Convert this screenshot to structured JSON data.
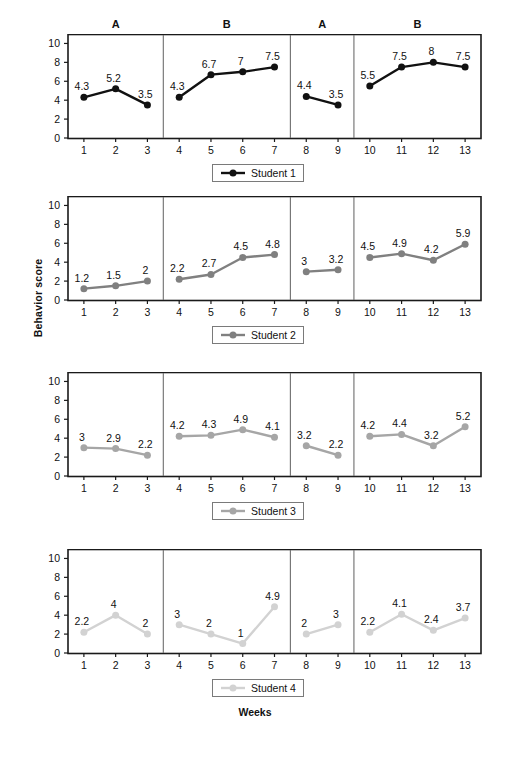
{
  "figure": {
    "y_axis_label": "Behavior score",
    "x_axis_label": "Weeks",
    "phase_labels": [
      "A",
      "B",
      "A",
      "B"
    ]
  },
  "chart_data": {
    "type": "line",
    "title": "",
    "xlabel": "Weeks",
    "ylabel": "Behavior score",
    "x": [
      1,
      2,
      3,
      4,
      5,
      6,
      7,
      8,
      9,
      10,
      11,
      12,
      13
    ],
    "xlim": [
      0.5,
      13.5
    ],
    "ylim": [
      0,
      11
    ],
    "yticks": [
      0,
      2,
      4,
      6,
      8,
      10
    ],
    "xticks": [
      1,
      2,
      3,
      4,
      5,
      6,
      7,
      8,
      9,
      10,
      11,
      12,
      13
    ],
    "grid": false,
    "legend_position": "below-each-panel",
    "design": "ABAB reversal",
    "phases": [
      {
        "label": "A",
        "weeks": [
          1,
          2,
          3
        ]
      },
      {
        "label": "B",
        "weeks": [
          4,
          5,
          6,
          7
        ]
      },
      {
        "label": "A",
        "weeks": [
          8,
          9
        ]
      },
      {
        "label": "B",
        "weeks": [
          10,
          11,
          12,
          13
        ]
      }
    ],
    "panels": [
      {
        "legend": "Student 1",
        "color": "#111111",
        "segments": [
          {
            "phase": "A",
            "x": [
              1,
              2,
              3
            ],
            "values": [
              4.3,
              5.2,
              3.5
            ],
            "labels": [
              "4.3",
              "5.2",
              "3.5"
            ]
          },
          {
            "phase": "B",
            "x": [
              4,
              5,
              6,
              7
            ],
            "values": [
              4.3,
              6.7,
              7,
              7.5
            ],
            "labels": [
              "4.3",
              "6.7",
              "7",
              "7.5"
            ]
          },
          {
            "phase": "A",
            "x": [
              8,
              9
            ],
            "values": [
              4.4,
              3.5
            ],
            "labels": [
              "4.4",
              "3.5"
            ]
          },
          {
            "phase": "B",
            "x": [
              10,
              11,
              12,
              13
            ],
            "values": [
              5.5,
              7.5,
              8,
              7.5
            ],
            "labels": [
              "5.5",
              "7.5",
              "8",
              "7.5"
            ]
          }
        ]
      },
      {
        "legend": "Student 2",
        "color": "#808080",
        "segments": [
          {
            "phase": "A",
            "x": [
              1,
              2,
              3
            ],
            "values": [
              1.2,
              1.5,
              2
            ],
            "labels": [
              "1.2",
              "1.5",
              "2"
            ]
          },
          {
            "phase": "B",
            "x": [
              4,
              5,
              6,
              7
            ],
            "values": [
              2.2,
              2.7,
              4.5,
              4.8
            ],
            "labels": [
              "2.2",
              "2.7",
              "4.5",
              "4.8"
            ]
          },
          {
            "phase": "A",
            "x": [
              8,
              9
            ],
            "values": [
              3,
              3.2
            ],
            "labels": [
              "3",
              "3.2"
            ]
          },
          {
            "phase": "B",
            "x": [
              10,
              11,
              12,
              13
            ],
            "values": [
              4.5,
              4.9,
              4.2,
              5.9
            ],
            "labels": [
              "4.5",
              "4.9",
              "4.2",
              "5.9"
            ]
          }
        ]
      },
      {
        "legend": "Student 3",
        "color": "#a6a6a6",
        "segments": [
          {
            "phase": "A",
            "x": [
              1,
              2,
              3
            ],
            "values": [
              3,
              2.9,
              2.2
            ],
            "labels": [
              "3",
              "2.9",
              "2.2"
            ]
          },
          {
            "phase": "B",
            "x": [
              4,
              5,
              6,
              7
            ],
            "values": [
              4.2,
              4.3,
              4.9,
              4.1
            ],
            "labels": [
              "4.2",
              "4.3",
              "4.9",
              "4.1"
            ]
          },
          {
            "phase": "A",
            "x": [
              8,
              9
            ],
            "values": [
              3.2,
              2.2
            ],
            "labels": [
              "3.2",
              "2.2"
            ]
          },
          {
            "phase": "B",
            "x": [
              10,
              11,
              12,
              13
            ],
            "values": [
              4.2,
              4.4,
              3.2,
              5.2
            ],
            "labels": [
              "4.2",
              "4.4",
              "3.2",
              "5.2"
            ]
          }
        ]
      },
      {
        "legend": "Student 4",
        "color": "#d2d2d2",
        "segments": [
          {
            "phase": "A",
            "x": [
              1,
              2,
              3
            ],
            "values": [
              2.2,
              4,
              2
            ],
            "labels": [
              "2.2",
              "4",
              "2"
            ]
          },
          {
            "phase": "B",
            "x": [
              4,
              5,
              6,
              7
            ],
            "values": [
              3,
              2,
              1,
              4.9
            ],
            "labels": [
              "3",
              "2",
              "1",
              "4.9"
            ]
          },
          {
            "phase": "A",
            "x": [
              8,
              9
            ],
            "values": [
              2,
              3
            ],
            "labels": [
              "2",
              "3"
            ]
          },
          {
            "phase": "B",
            "x": [
              10,
              11,
              12,
              13
            ],
            "values": [
              2.2,
              4.1,
              2.4,
              3.7
            ],
            "labels": [
              "2.2",
              "4.1",
              "2.4",
              "3.7"
            ]
          }
        ]
      }
    ]
  }
}
